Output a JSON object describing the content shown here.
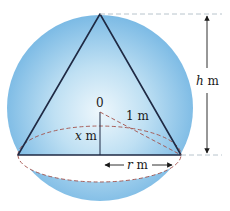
{
  "figure": {
    "labels": {
      "center": "0",
      "sphere_radius": "1 m",
      "x_var": "x",
      "x_unit": " m",
      "h_var": "h",
      "h_unit": " m",
      "r_var": "r",
      "r_unit": " m"
    },
    "colors": {
      "sphere_fill": "#7fbde6",
      "sphere_highlight": "#e9f4fb",
      "cone_edge": "#1f2a44",
      "dashed": "#a3504a",
      "guide_dash": "#b8c4cc",
      "arrow": "#1a1a1a"
    }
  }
}
